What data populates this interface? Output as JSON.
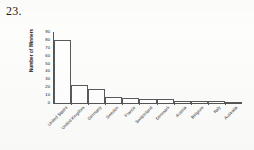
{
  "item_number": "23.",
  "chart_data": {
    "type": "bar",
    "title": "",
    "xlabel": "",
    "ylabel": "Number of Winners",
    "ylim": [
      0,
      90
    ],
    "ytick_step": 10,
    "yticks": [
      "90",
      "80",
      "70",
      "60",
      "50",
      "40",
      "30",
      "20",
      "10",
      "0"
    ],
    "grid": false,
    "legend": "none",
    "categories": [
      "United States",
      "United Kingdom",
      "Germany",
      "Sweden",
      "France",
      "Switzerland",
      "Denmark",
      "Austria",
      "Belgium",
      "Italy",
      "Australia"
    ],
    "values": [
      80,
      23,
      18,
      7,
      6,
      5,
      5,
      3,
      2,
      2,
      1
    ]
  },
  "colors": {
    "bar_fill": "#ffffff",
    "bar_stroke": "#5a5a5a",
    "axis": "#555555",
    "text": "#1a1a1a",
    "page_background": "#fdfdfb"
  }
}
